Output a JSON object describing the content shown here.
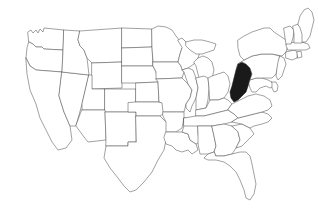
{
  "figure": {
    "kind": "choropleth-outline-map",
    "region": "Contiguous United States",
    "background_color": "#ffffff",
    "border_color": "#555555",
    "state_fill_color": "#ffffff",
    "highlight_fill_color": "#1a1a1a",
    "border_width_px": 0.55,
    "has_labels": false,
    "has_legend": false,
    "has_title": false,
    "width_px": 318,
    "height_px": 219
  },
  "highlight": {
    "state_code": "WV",
    "state_name": "West Virginia",
    "fill": "#1a1a1a"
  },
  "states": [
    {
      "code": "WA",
      "name": "Washington",
      "highlighted": false
    },
    {
      "code": "OR",
      "name": "Oregon",
      "highlighted": false
    },
    {
      "code": "CA",
      "name": "California",
      "highlighted": false
    },
    {
      "code": "NV",
      "name": "Nevada",
      "highlighted": false
    },
    {
      "code": "ID",
      "name": "Idaho",
      "highlighted": false
    },
    {
      "code": "MT",
      "name": "Montana",
      "highlighted": false
    },
    {
      "code": "WY",
      "name": "Wyoming",
      "highlighted": false
    },
    {
      "code": "UT",
      "name": "Utah",
      "highlighted": false
    },
    {
      "code": "AZ",
      "name": "Arizona",
      "highlighted": false
    },
    {
      "code": "NM",
      "name": "New Mexico",
      "highlighted": false
    },
    {
      "code": "CO",
      "name": "Colorado",
      "highlighted": false
    },
    {
      "code": "ND",
      "name": "North Dakota",
      "highlighted": false
    },
    {
      "code": "SD",
      "name": "South Dakota",
      "highlighted": false
    },
    {
      "code": "NE",
      "name": "Nebraska",
      "highlighted": false
    },
    {
      "code": "KS",
      "name": "Kansas",
      "highlighted": false
    },
    {
      "code": "OK",
      "name": "Oklahoma",
      "highlighted": false
    },
    {
      "code": "TX",
      "name": "Texas",
      "highlighted": false
    },
    {
      "code": "MN",
      "name": "Minnesota",
      "highlighted": false
    },
    {
      "code": "IA",
      "name": "Iowa",
      "highlighted": false
    },
    {
      "code": "MO",
      "name": "Missouri",
      "highlighted": false
    },
    {
      "code": "AR",
      "name": "Arkansas",
      "highlighted": false
    },
    {
      "code": "LA",
      "name": "Louisiana",
      "highlighted": false
    },
    {
      "code": "WI",
      "name": "Wisconsin",
      "highlighted": false
    },
    {
      "code": "IL",
      "name": "Illinois",
      "highlighted": false
    },
    {
      "code": "MS",
      "name": "Mississippi",
      "highlighted": false
    },
    {
      "code": "MI",
      "name": "Michigan",
      "highlighted": false
    },
    {
      "code": "IN",
      "name": "Indiana",
      "highlighted": false
    },
    {
      "code": "OH",
      "name": "Ohio",
      "highlighted": false
    },
    {
      "code": "KY",
      "name": "Kentucky",
      "highlighted": false
    },
    {
      "code": "TN",
      "name": "Tennessee",
      "highlighted": false
    },
    {
      "code": "AL",
      "name": "Alabama",
      "highlighted": false
    },
    {
      "code": "GA",
      "name": "Georgia",
      "highlighted": false
    },
    {
      "code": "FL",
      "name": "Florida",
      "highlighted": false
    },
    {
      "code": "SC",
      "name": "South Carolina",
      "highlighted": false
    },
    {
      "code": "NC",
      "name": "North Carolina",
      "highlighted": false
    },
    {
      "code": "VA",
      "name": "Virginia",
      "highlighted": false
    },
    {
      "code": "WV",
      "name": "West Virginia",
      "highlighted": true
    },
    {
      "code": "MD",
      "name": "Maryland",
      "highlighted": false
    },
    {
      "code": "DE",
      "name": "Delaware",
      "highlighted": false
    },
    {
      "code": "PA",
      "name": "Pennsylvania",
      "highlighted": false
    },
    {
      "code": "NJ",
      "name": "New Jersey",
      "highlighted": false
    },
    {
      "code": "NY",
      "name": "New York",
      "highlighted": false
    },
    {
      "code": "CT",
      "name": "Connecticut",
      "highlighted": false
    },
    {
      "code": "RI",
      "name": "Rhode Island",
      "highlighted": false
    },
    {
      "code": "MA",
      "name": "Massachusetts",
      "highlighted": false
    },
    {
      "code": "VT",
      "name": "Vermont",
      "highlighted": false
    },
    {
      "code": "NH",
      "name": "New Hampshire",
      "highlighted": false
    },
    {
      "code": "ME",
      "name": "Maine",
      "highlighted": false
    }
  ]
}
